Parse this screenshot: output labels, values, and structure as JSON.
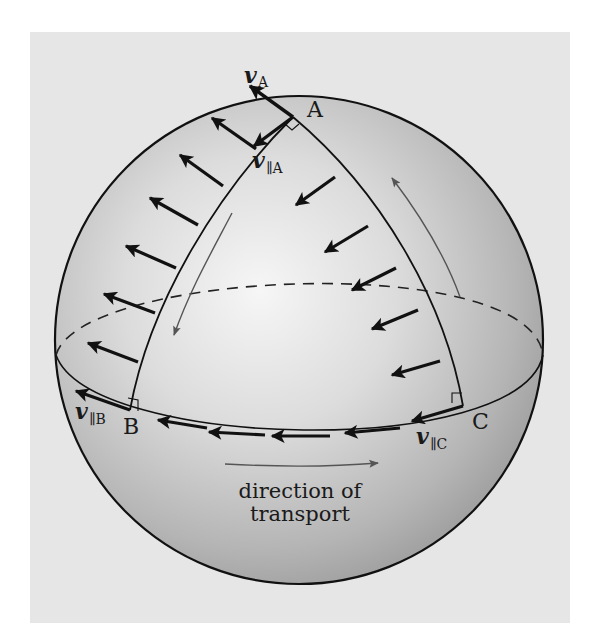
{
  "figure": {
    "colors": {
      "panel": "#e6e6e6",
      "sphere_highlight": "#f4f4f4",
      "sphere_mid": "#c8c8c8",
      "sphere_edge": "#9e9e9e",
      "ink": "#111111",
      "guide_arrow": "#555555"
    },
    "sphere": {
      "cx": 299,
      "cy": 340,
      "r": 244
    },
    "points": {
      "A": {
        "label": "A",
        "x": 293,
        "y": 117
      },
      "B": {
        "label": "B",
        "x": 130,
        "y": 410
      },
      "C": {
        "label": "C",
        "x": 463,
        "y": 406
      }
    },
    "vector_labels": {
      "vA": {
        "symbol": "v",
        "subscript": "A"
      },
      "vParA": {
        "symbol": "v",
        "subscript": "∥A"
      },
      "vParB": {
        "symbol": "v",
        "subscript": "∥B"
      },
      "vParC": {
        "symbol": "v",
        "subscript": "∥C"
      }
    },
    "caption": {
      "line1": "direction of",
      "line2": "transport"
    }
  }
}
